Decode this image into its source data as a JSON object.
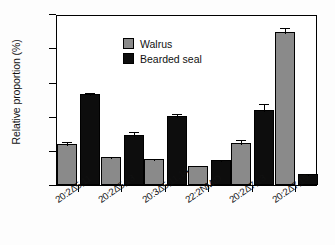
{
  "chart_data": {
    "type": "bar",
    "title": "",
    "xlabel": "",
    "ylabel": "Relative proportion (%)",
    "ylim": [
      0.0,
      0.5
    ],
    "ytick_labels": [
      "0.0",
      "0.1",
      "0.2",
      "0.3",
      "0.4",
      "0.5"
    ],
    "ytick_values": [
      0.0,
      0.1,
      0.2,
      0.3,
      0.4,
      0.5
    ],
    "grid": false,
    "legend_position": "top-left",
    "categories": [
      "20:2Δ5,11",
      "20:2Δ5,13",
      "20:3Δ5,11,14",
      "22:2NMID",
      "20:2Δ7,13",
      "20:2Δ7,15"
    ],
    "series": [
      {
        "name": "Walrus",
        "color": "#8a8a8a",
        "values": [
          0.119,
          0.082,
          0.075,
          0.057,
          0.123,
          0.447
        ],
        "errors": [
          0.012,
          0.005,
          0.006,
          0.004,
          0.013,
          0.019
        ]
      },
      {
        "name": "Bearded seal",
        "color": "#0d0d0d",
        "values": [
          0.267,
          0.147,
          0.201,
          0.073,
          0.219,
          0.033
        ],
        "errors": [
          0.008,
          0.013,
          0.012,
          0.007,
          0.024,
          0.006
        ]
      }
    ]
  },
  "legend": {
    "items": [
      {
        "label": "Walrus",
        "color": "#8a8a8a"
      },
      {
        "label": "Bearded seal",
        "color": "#0d0d0d"
      }
    ]
  }
}
